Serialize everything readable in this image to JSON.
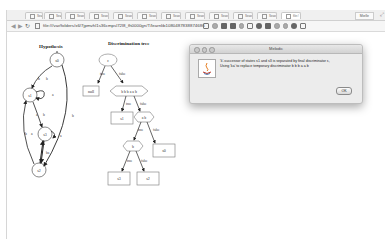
{
  "browser": {
    "tabs": [
      {
        "label": "Search",
        "active": false
      },
      {
        "label": "Search",
        "active": false
      },
      {
        "label": "Search",
        "active": false
      },
      {
        "label": "Search",
        "active": false
      },
      {
        "label": "Search",
        "active": false
      },
      {
        "label": "Search",
        "active": false
      },
      {
        "label": "Search",
        "active": false
      },
      {
        "label": "Search",
        "active": false
      },
      {
        "label": "Search",
        "active": false
      },
      {
        "label": "Search",
        "active": false
      },
      {
        "label": "Search",
        "active": false
      },
      {
        "label": "file:/",
        "active": true
      }
    ],
    "profile_label": "Mielle",
    "url": "file:///var/folders/x6/7jpmvhl1s36cmpsl72l8_fh0000gn/T/learnlib1080487838874686",
    "nav": {
      "back": "◀",
      "forward": "▶",
      "reload": "↻"
    }
  },
  "hypothesis": {
    "title": "Hypothesis",
    "states": [
      "s0",
      "s1",
      "s3",
      "s2"
    ],
    "edge_labels": [
      "b",
      "b",
      "a",
      "b",
      "a",
      "b",
      "b",
      "a",
      "a",
      "ba"
    ]
  },
  "discrimination_tree": {
    "title": "Discrimination tree",
    "root": "ε",
    "null_leaf": "null",
    "node_bbbaab": "b b b a a b",
    "leaf_s1": "s1",
    "node_ab": "a b",
    "leaf_s0": "s0",
    "node_b": "b",
    "leaf_s3": "s3",
    "leaf_s2": "s2",
    "true_label": "true",
    "false_label": "false"
  },
  "dialog": {
    "title": "Melodic",
    "message_line1": "'k'-successor of states s1 and s3 is separated by final discriminator ε,",
    "message_line2": "Using 'ka' to replace temporary discriminator b b b a a b",
    "ok_label": "OK"
  }
}
